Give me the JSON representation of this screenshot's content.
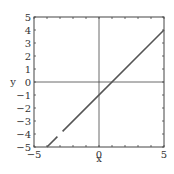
{
  "chart_data": {
    "type": "line",
    "title": "",
    "xlabel": "x",
    "ylabel": "y",
    "xlim": [
      -5,
      5
    ],
    "ylim": [
      -5,
      5
    ],
    "x_ticks": [
      -5,
      0,
      5
    ],
    "x_tick_labels": [
      "−5",
      "0",
      "5"
    ],
    "y_ticks": [
      5,
      4,
      3,
      2,
      1,
      0,
      -1,
      -2,
      -3,
      -4,
      -5
    ],
    "y_tick_labels": [
      "5",
      "4",
      "3",
      "2",
      "1",
      "0",
      "−1",
      "−2",
      "−3",
      "−4",
      "−5"
    ],
    "minor_tick_step": 1,
    "grid": false,
    "reference_lines": {
      "x": 0,
      "y": 0
    },
    "legend": null,
    "series": [
      {
        "name": "y = x - 1",
        "segments": [
          {
            "x": [
              -4,
              -3.2
            ],
            "y": [
              -5,
              -4.2
            ]
          },
          {
            "x": [
              -2.8,
              5
            ],
            "y": [
              -3.8,
              4
            ]
          }
        ],
        "color": "#555555"
      }
    ]
  },
  "colors": {
    "axis": "#444444",
    "line": "#555555",
    "text": "#333333",
    "background": "#ffffff"
  }
}
